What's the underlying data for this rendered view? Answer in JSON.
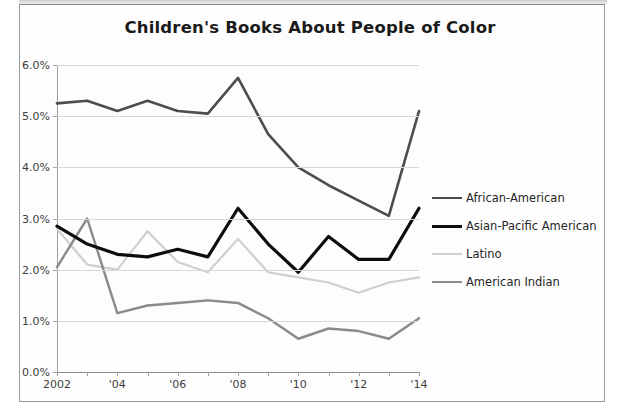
{
  "figure": {
    "title": "Children's Books About People of Color"
  },
  "chart_data": {
    "type": "line",
    "title": "Children's Books About People of Color",
    "xlabel": "",
    "ylabel": "",
    "grid": true,
    "legend_position": "right",
    "x": [
      2002,
      2003,
      2004,
      2005,
      2006,
      2007,
      2008,
      2009,
      2010,
      2011,
      2012,
      2013,
      2014
    ],
    "xtick_labels": [
      "2002",
      "",
      "'04",
      "",
      "'06",
      "",
      "'08",
      "",
      "'10",
      "",
      "'12",
      "",
      "'14"
    ],
    "ytick_labels": [
      "0.0%",
      "1.0%",
      "2.0%",
      "3.0%",
      "4.0%",
      "5.0%",
      "6.0%"
    ],
    "ytick_values": [
      0.0,
      1.0,
      2.0,
      3.0,
      4.0,
      5.0,
      6.0
    ],
    "ylim": [
      0.0,
      6.0
    ],
    "xlim": [
      2002,
      2014
    ],
    "series": [
      {
        "name": "African-American",
        "color": "#4d4d4d",
        "width": 2.6,
        "values": [
          5.25,
          5.3,
          5.1,
          5.3,
          5.1,
          5.05,
          5.75,
          4.65,
          4.0,
          3.65,
          3.35,
          3.05,
          5.1
        ]
      },
      {
        "name": "Asian-Pacific American",
        "color": "#0d0d0d",
        "width": 3.2,
        "values": [
          2.85,
          2.5,
          2.3,
          2.25,
          2.4,
          2.25,
          3.2,
          2.5,
          1.95,
          2.65,
          2.2,
          2.2,
          3.2
        ]
      },
      {
        "name": "Latino",
        "color": "#cfcfcf",
        "width": 2.2,
        "values": [
          2.8,
          2.1,
          2.0,
          2.75,
          2.15,
          1.95,
          2.6,
          1.95,
          1.85,
          1.75,
          1.55,
          1.75,
          1.85
        ]
      },
      {
        "name": "American Indian",
        "color": "#8a8a8a",
        "width": 2.4,
        "values": [
          2.05,
          3.0,
          1.15,
          1.3,
          1.35,
          1.4,
          1.35,
          1.05,
          0.65,
          0.85,
          0.8,
          0.65,
          1.05
        ]
      }
    ]
  },
  "legend": {
    "items": [
      {
        "label": "African-American"
      },
      {
        "label": "Asian-Pacific American"
      },
      {
        "label": "Latino"
      },
      {
        "label": "American Indian"
      }
    ]
  }
}
